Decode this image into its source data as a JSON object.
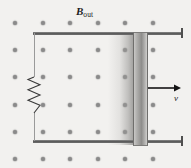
{
  "figure": {
    "type": "physics-diagram",
    "canvas": {
      "width": 191,
      "height": 168,
      "background": "#f2f1ef"
    }
  },
  "labels": {
    "field_symbol": "B",
    "field_subscript": "out",
    "velocity_symbol": "v"
  },
  "field": {
    "icon_name": "field-out-of-page-dot",
    "direction": "out-of-page",
    "dot_color": "#8a8a8a",
    "columns": 6,
    "rows": 6,
    "x_start": 13,
    "y_start": 21,
    "x_spacing": 27.6,
    "y_spacing": 27.2
  },
  "circuit": {
    "top_rail": {
      "x": 33,
      "y": 32,
      "width": 150,
      "color": "#5a5a5a"
    },
    "bottom_rail": {
      "x": 33,
      "y": 140,
      "width": 150,
      "color": "#5a5a5a"
    },
    "left_wire": {
      "x": 34,
      "y": 33,
      "height": 108,
      "color": "#9a9a9a"
    },
    "resistor": {
      "name": "resistor-zigzag",
      "x": 34,
      "y_top": 77,
      "y_bottom": 113,
      "amplitude": 6,
      "color": "#3a3a3a"
    },
    "rail_endcap_top": {
      "x": 181,
      "y": 28,
      "height": 10
    },
    "rail_endcap_bottom": {
      "x": 181,
      "y": 136,
      "height": 10
    }
  },
  "slider": {
    "name": "sliding-conductor-bar",
    "x": 133,
    "y": 32,
    "width": 15,
    "height": 114,
    "motion_blur": {
      "x": 108,
      "y": 33,
      "width": 26,
      "height": 112
    }
  },
  "velocity": {
    "name": "velocity-vector-arrow",
    "x1": 148,
    "y1": 88,
    "x2": 181,
    "y2": 88,
    "color": "#141414",
    "label_x": 174,
    "label_y": 94
  },
  "label_positions": {
    "field_label_x": 76,
    "field_label_y": 6
  }
}
